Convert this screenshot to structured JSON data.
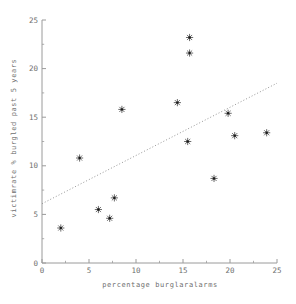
{
  "figure": {
    "background": "#ffffff",
    "axis_color": "#9a9a9a",
    "text_color": "#6e6e6e",
    "marker_color": "#3a3a3a",
    "marker_center_color": "#1a1a1a",
    "trend_color": "#8a8a8a"
  },
  "chart_data": {
    "type": "scatter",
    "title": "",
    "xlabel": "percentage burglaralarms",
    "ylabel": "victimrate % burgled past 5 years",
    "xlim": [
      0,
      25
    ],
    "ylim": [
      0,
      25
    ],
    "x_ticks": [
      0,
      5,
      10,
      15,
      20,
      25
    ],
    "y_ticks": [
      0,
      5,
      10,
      15,
      20,
      25
    ],
    "minor_tick_step": 2.5,
    "grid": false,
    "legend": false,
    "marker": "asterisk-8-spoke",
    "points": [
      {
        "x": 2.0,
        "y": 3.6
      },
      {
        "x": 4.0,
        "y": 10.8
      },
      {
        "x": 6.0,
        "y": 5.5
      },
      {
        "x": 7.2,
        "y": 4.6
      },
      {
        "x": 7.7,
        "y": 6.7
      },
      {
        "x": 8.5,
        "y": 15.8
      },
      {
        "x": 14.4,
        "y": 16.5
      },
      {
        "x": 15.5,
        "y": 12.5
      },
      {
        "x": 15.7,
        "y": 21.6
      },
      {
        "x": 15.7,
        "y": 23.2
      },
      {
        "x": 18.3,
        "y": 8.7
      },
      {
        "x": 19.8,
        "y": 15.4
      },
      {
        "x": 20.5,
        "y": 13.1
      },
      {
        "x": 23.9,
        "y": 13.4
      }
    ],
    "trendline": {
      "style": "dotted",
      "x_start": 0,
      "y_start": 6.1,
      "x_end": 25,
      "y_end": 18.5
    }
  }
}
